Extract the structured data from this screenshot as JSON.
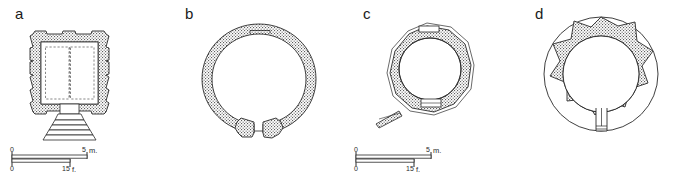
{
  "figure": {
    "background_color": "#ffffff",
    "ink_color": "#1a1a1a",
    "wall_fill_color": "#9a9a9a",
    "panel_count": 4
  },
  "panels": [
    {
      "id": "a",
      "label": "a",
      "plan_type": "square walled enclosure with inner chamber and stepped entrance stair",
      "scale": {
        "metric_start": "0",
        "metric_end": "5",
        "metric_unit": "m.",
        "imperial_start": "0",
        "imperial_end": "15",
        "imperial_unit": "f."
      }
    },
    {
      "id": "b",
      "label": "b",
      "plan_type": "circular ring wall with entrance gap at bottom",
      "scale": {
        "metric_start": "0",
        "metric_end": "5",
        "metric_unit": "m.",
        "imperial_start": "0",
        "imperial_end": "15",
        "imperial_unit": "f."
      }
    },
    {
      "id": "c",
      "label": "c",
      "plan_type": "polygonal ring wall with circular interior and projecting wall stub",
      "scale": {
        "metric_start": "0",
        "metric_end": "5",
        "metric_unit": "m.",
        "imperial_start": "0",
        "imperial_end": "15",
        "imperial_unit": "f."
      }
    },
    {
      "id": "d",
      "label": "d",
      "plan_type": "circular outer wall with lobed star inner mass, central round chamber and south passage",
      "scale": {
        "metric_start": "0",
        "metric_end": "5",
        "metric_unit": "m.",
        "imperial_start": "0",
        "imperial_end": "15",
        "imperial_unit": "f."
      }
    }
  ]
}
